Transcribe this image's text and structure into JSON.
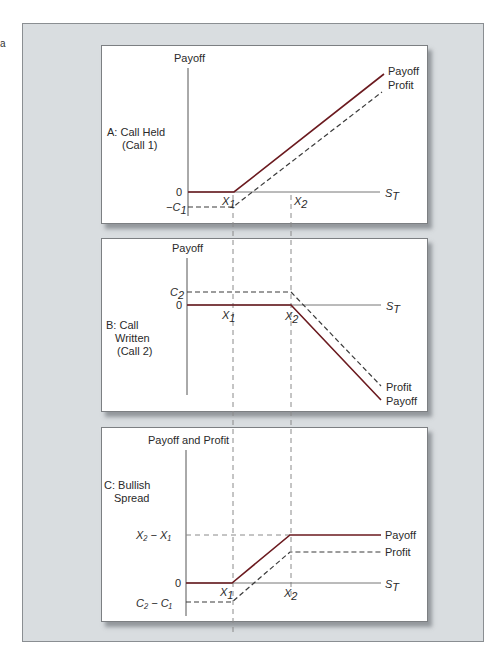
{
  "corner_mark": "a",
  "colors": {
    "payoff_line": "#6b1a1f",
    "profit_line": "#3a3a3a",
    "axis": "#555555",
    "guide": "#8a8a8a",
    "frame_bg": "#d9dde0"
  },
  "panels": [
    {
      "id": "A",
      "title_line1": "A: Call Held",
      "title_line2": "(Call 1)",
      "y_axis_label": "Payoff",
      "x_axis_label": "S",
      "x_axis_sub": "T",
      "y_ticks": [
        {
          "label": "0"
        },
        {
          "label": "−C",
          "sub": "1"
        }
      ],
      "x_ticks": [
        {
          "label": "X",
          "sub": "1"
        },
        {
          "label": "X",
          "sub": "2"
        }
      ],
      "line_labels": {
        "payoff": "Payoff",
        "profit": "Profit"
      }
    },
    {
      "id": "B",
      "title_line1": "B: Call",
      "title_line2": "Written",
      "title_line3": "(Call 2)",
      "y_axis_label": "Payoff",
      "x_axis_label": "S",
      "x_axis_sub": "T",
      "y_ticks": [
        {
          "label": "C",
          "sub": "2"
        },
        {
          "label": "0"
        }
      ],
      "x_ticks": [
        {
          "label": "X",
          "sub": "1"
        },
        {
          "label": "X",
          "sub": "2"
        }
      ],
      "line_labels": {
        "profit": "Profit",
        "payoff": "Payoff"
      }
    },
    {
      "id": "C",
      "title_line1": "C: Bullish",
      "title_line2": "Spread",
      "y_axis_label": "Payoff and Profit",
      "x_axis_label": "S",
      "x_axis_sub": "T",
      "y_ticks": [
        {
          "label": "X₂ − X₁"
        },
        {
          "label": "0"
        },
        {
          "label": "C₂ − C₁"
        }
      ],
      "x_ticks": [
        {
          "label": "X",
          "sub": "1"
        },
        {
          "label": "X",
          "sub": "2"
        }
      ],
      "line_labels": {
        "payoff": "Payoff",
        "profit": "Profit"
      }
    }
  ]
}
